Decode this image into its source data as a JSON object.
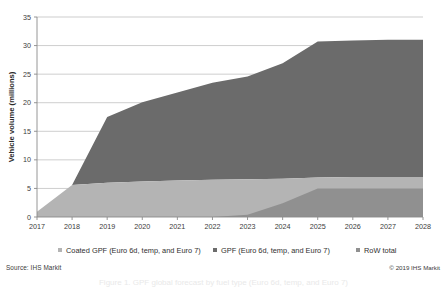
{
  "chart_data": {
    "type": "area",
    "title": "",
    "xlabel": "",
    "ylabel": "Vehicle volume (millions)",
    "categories": [
      "2017",
      "2018",
      "2019",
      "2020",
      "2021",
      "2022",
      "2023",
      "2024",
      "2025",
      "2026",
      "2027",
      "2028"
    ],
    "x": [
      2017,
      2018,
      2019,
      2020,
      2021,
      2022,
      2023,
      2024,
      2025,
      2026,
      2027,
      2028
    ],
    "ylim": [
      0,
      35
    ],
    "yticks": [
      0,
      5,
      10,
      15,
      20,
      25,
      30,
      35
    ],
    "grid": true,
    "stacked": true,
    "legend_position": "bottom",
    "series": [
      {
        "name": "Coated GPF (Euro 6d, temp, and Euro 7)",
        "color": "#b4b4b4",
        "values": [
          0.9,
          5.6,
          6.0,
          6.2,
          6.4,
          6.5,
          6.6,
          6.7,
          6.9,
          7.0,
          7.0,
          7.0
        ]
      },
      {
        "name": "GPF (Euro 6d, temp, and Euro 7)",
        "color": "#6b6b6b",
        "values": [
          0.0,
          0.0,
          11.5,
          13.9,
          15.4,
          17.0,
          17.6,
          17.8,
          16.8,
          16.6,
          16.5,
          16.4
        ]
      },
      {
        "name": "RoW total",
        "color": "#909090",
        "values": [
          0.0,
          0.0,
          0.0,
          0.0,
          0.0,
          0.0,
          0.4,
          2.4,
          7.0,
          7.3,
          7.5,
          7.6
        ]
      }
    ],
    "totals": [
      0.9,
      5.6,
      17.5,
      20.1,
      21.8,
      23.5,
      24.6,
      26.9,
      30.7,
      30.9,
      31.0,
      31.0
    ]
  },
  "legend": {
    "items": [
      {
        "label": "Coated GPF (Euro 6d, temp, and Euro 7)",
        "color": "#b4b4b4",
        "marker": "square-swatch"
      },
      {
        "label": "GPF (Euro 6d, temp, and Euro 7)",
        "color": "#6b6b6b",
        "marker": "square-swatch"
      },
      {
        "label": "RoW total",
        "color": "#909090",
        "marker": "square-swatch"
      }
    ]
  },
  "footer": {
    "source": "Source: IHS Markit",
    "copyright": "© 2019 IHS Markit"
  },
  "caption": {
    "text": "Figure 1. GPF global forecast by fuel type (Euro 6d, temp, and Euro 7)"
  },
  "colors": {
    "axis": "#8a8a8a",
    "grid": "#b8b8b8",
    "text": "#333333",
    "background": "#ffffff"
  }
}
